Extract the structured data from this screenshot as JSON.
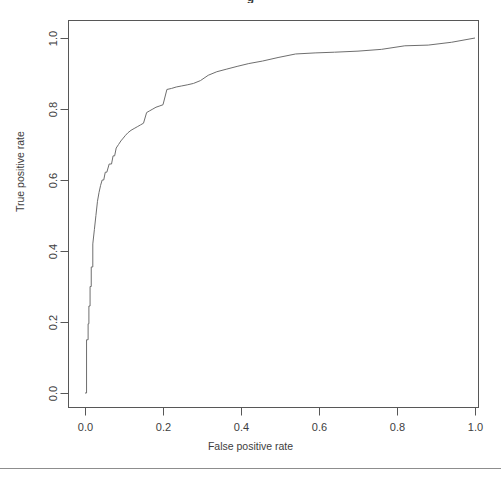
{
  "figure": {
    "title_fragment": "g",
    "footer_rule": true
  },
  "chart_data": {
    "type": "line",
    "title": "g",
    "xlabel": "False positive rate",
    "ylabel": "True positive rate",
    "xlim": [
      0.0,
      1.0
    ],
    "ylim": [
      0.0,
      1.0
    ],
    "xticks": [
      "0.0",
      "0.2",
      "0.4",
      "0.6",
      "0.8",
      "1.0"
    ],
    "yticks": [
      "0.0",
      "0.2",
      "0.4",
      "0.6",
      "0.8",
      "1.0"
    ],
    "xtick_values": [
      0.0,
      0.2,
      0.4,
      0.6,
      0.8,
      1.0
    ],
    "ytick_values": [
      0.0,
      0.2,
      0.4,
      0.6,
      0.8,
      1.0
    ],
    "grid": false,
    "legend": false,
    "box": true,
    "line_color": "#6e6e6e",
    "line_width": 1,
    "series": [
      {
        "name": "ROC curve",
        "x": [
          0.0,
          0.004,
          0.004,
          0.008,
          0.008,
          0.01,
          0.01,
          0.013,
          0.013,
          0.016,
          0.016,
          0.02,
          0.02,
          0.024,
          0.028,
          0.032,
          0.036,
          0.04,
          0.044,
          0.048,
          0.052,
          0.056,
          0.062,
          0.068,
          0.072,
          0.076,
          0.08,
          0.086,
          0.092,
          0.098,
          0.104,
          0.11,
          0.118,
          0.126,
          0.134,
          0.142,
          0.15,
          0.158,
          0.166,
          0.174,
          0.182,
          0.19,
          0.2,
          0.21,
          0.222,
          0.234,
          0.248,
          0.262,
          0.278,
          0.296,
          0.316,
          0.338,
          0.362,
          0.39,
          0.42,
          0.455,
          0.495,
          0.54,
          0.59,
          0.64,
          0.7,
          0.76,
          0.82,
          0.88,
          0.94,
          1.0
        ],
        "y": [
          0.0,
          0.0,
          0.15,
          0.15,
          0.195,
          0.195,
          0.245,
          0.245,
          0.3,
          0.3,
          0.355,
          0.355,
          0.42,
          0.46,
          0.5,
          0.54,
          0.565,
          0.585,
          0.6,
          0.6,
          0.622,
          0.622,
          0.645,
          0.645,
          0.668,
          0.668,
          0.69,
          0.7,
          0.71,
          0.718,
          0.726,
          0.733,
          0.74,
          0.745,
          0.75,
          0.755,
          0.76,
          0.79,
          0.795,
          0.8,
          0.805,
          0.808,
          0.812,
          0.855,
          0.858,
          0.862,
          0.865,
          0.868,
          0.872,
          0.88,
          0.895,
          0.905,
          0.912,
          0.92,
          0.928,
          0.935,
          0.945,
          0.955,
          0.958,
          0.96,
          0.963,
          0.968,
          0.978,
          0.98,
          0.988,
          1.0
        ]
      }
    ]
  }
}
